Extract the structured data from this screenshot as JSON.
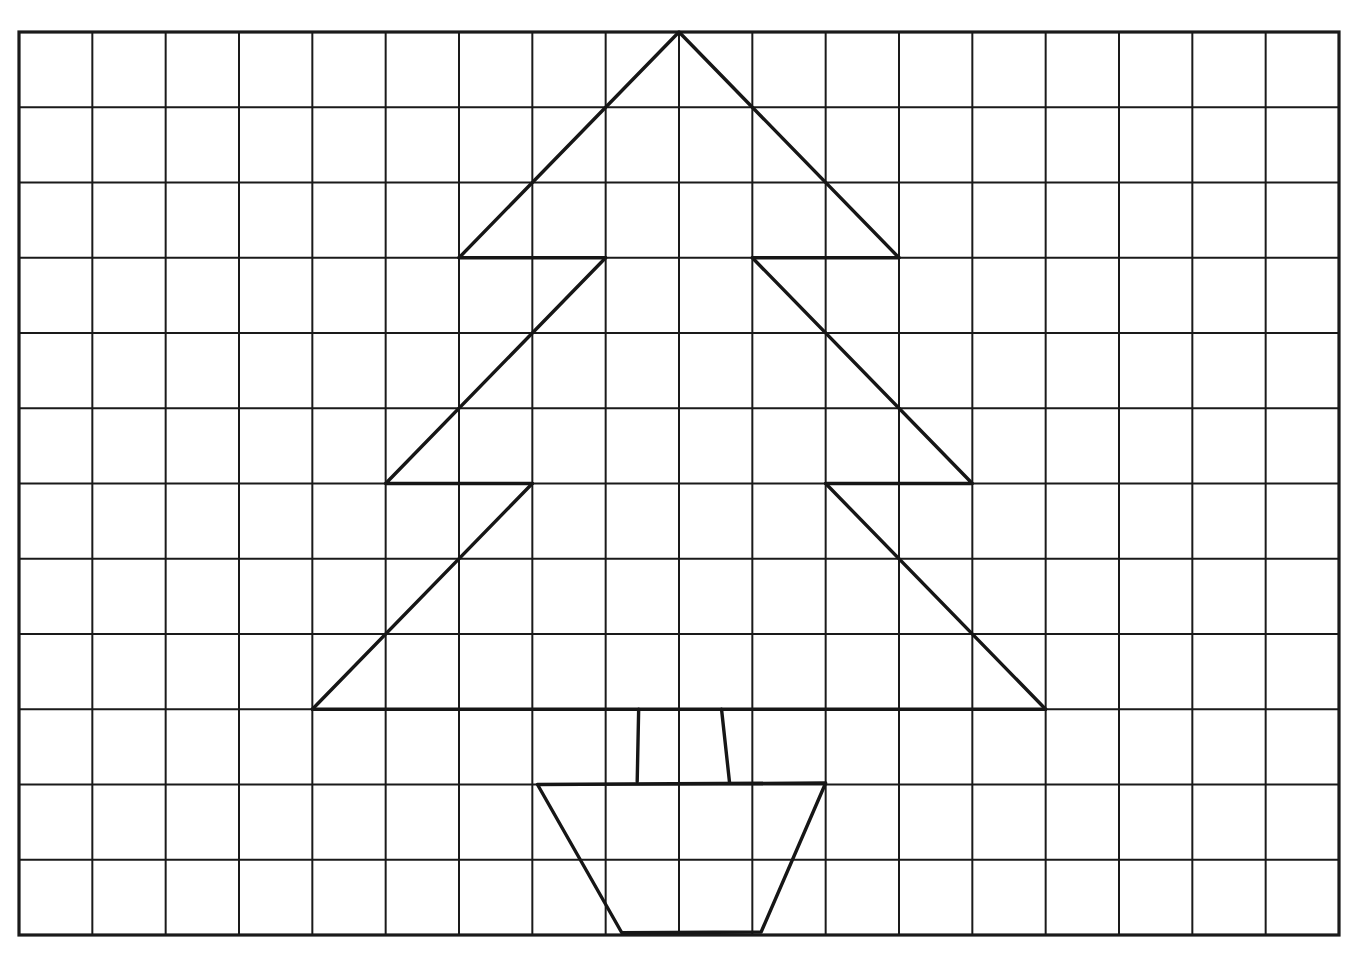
{
  "diagram": {
    "title": "",
    "colors": {
      "background": "#ffffff",
      "grid": "#1a1a1a",
      "ink": "#161616"
    },
    "grid": {
      "columns": 18,
      "rows": 12,
      "origin_px": [
        19,
        32
      ],
      "extent_px": [
        1339,
        935
      ]
    },
    "shapes": [
      {
        "name": "tree-tier-top",
        "type": "polyline",
        "points": [
          [
            6,
            3
          ],
          [
            9,
            0
          ],
          [
            12,
            3
          ]
        ],
        "closed": false
      },
      {
        "name": "tree-tier-top-base-left",
        "type": "polyline",
        "points": [
          [
            6,
            3
          ],
          [
            8,
            3
          ]
        ],
        "closed": false
      },
      {
        "name": "tree-tier-top-base-right",
        "type": "polyline",
        "points": [
          [
            10,
            3
          ],
          [
            12,
            3
          ]
        ],
        "closed": false
      },
      {
        "name": "tree-tier-middle-left-edge",
        "type": "polyline",
        "points": [
          [
            8,
            3
          ],
          [
            5,
            6
          ],
          [
            7,
            6
          ]
        ],
        "closed": false
      },
      {
        "name": "tree-tier-middle-right-edge",
        "type": "polyline",
        "points": [
          [
            10,
            3
          ],
          [
            13,
            6
          ],
          [
            11,
            6
          ]
        ],
        "closed": false
      },
      {
        "name": "tree-tier-bottom-left-edge",
        "type": "polyline",
        "points": [
          [
            7,
            6
          ],
          [
            4,
            9
          ]
        ],
        "closed": false
      },
      {
        "name": "tree-tier-bottom-right-edge",
        "type": "polyline",
        "points": [
          [
            11,
            6
          ],
          [
            14,
            9
          ]
        ],
        "closed": false
      },
      {
        "name": "tree-tier-bottom-base",
        "type": "polyline",
        "points": [
          [
            4,
            9
          ],
          [
            14,
            9
          ]
        ],
        "closed": false
      },
      {
        "name": "trunk-left",
        "type": "polyline",
        "points": [
          [
            8.45,
            9
          ],
          [
            8.43,
            9.96
          ]
        ],
        "closed": false
      },
      {
        "name": "trunk-right",
        "type": "polyline",
        "points": [
          [
            9.58,
            9
          ],
          [
            9.69,
            9.98
          ]
        ],
        "closed": false
      },
      {
        "name": "pot",
        "type": "polygon",
        "points": [
          [
            7.07,
            10.0
          ],
          [
            11.0,
            9.98
          ],
          [
            10.12,
            11.96
          ],
          [
            8.22,
            11.97
          ]
        ],
        "closed": true
      }
    ]
  }
}
